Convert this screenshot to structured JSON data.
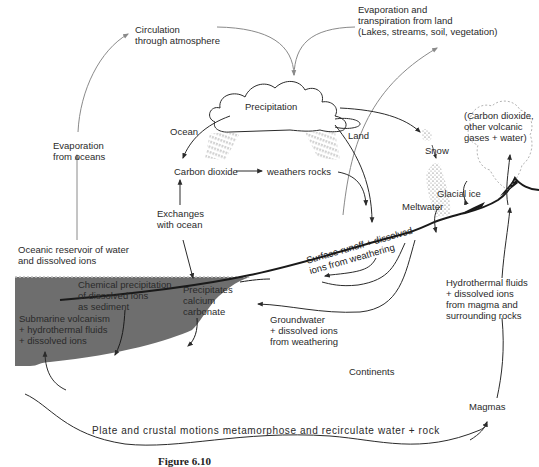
{
  "diagram": {
    "caption": "Figure 6.10",
    "colors": {
      "ocean_fill": "#6e6e6e",
      "line": "#2b2b2b",
      "arrow_light": "#8a8a8a",
      "text": "#2a2a2a",
      "background": "#ffffff"
    },
    "labels": {
      "circulation": "Circulation\nthrough atmosphere",
      "evap_land": "Evaporation and\ntranspiration from land\n(Lakes, streams, soil, vegetation)",
      "evap_oceans": "Evaporation\nfrom oceans",
      "precipitation": "Precipitation",
      "ocean": "Ocean",
      "land": "Land",
      "snow": "Snow",
      "volcanic_gases": "(Carbon dioxide,\nother volcanic\ngases + water)",
      "carbon_dioxide": "Carbon dioxide",
      "weathers_rocks": "weathers rocks",
      "glacial_ice": "Glacial ice",
      "meltwater": "Meltwater",
      "exchanges": "Exchanges\nwith ocean",
      "oceanic_reservoir": "Oceanic reservoir of water\nand dissolved ions",
      "surface_runoff": "Surface runoff + dissolved\nions from weathering",
      "chemical_precip": "Chemical precipitation\nof dissolved ions\nas sediment",
      "precip_caco3": "Precipitates\ncalcium\ncarbonate",
      "submarine": "Submarine volcanism\n+ hydrothermal fluids\n+ dissolved ions",
      "hydrothermal": "Hydrothermal fluids\n+ dissolved ions\nfrom magma and\nsurrounding rocks",
      "groundwater": "Groundwater\n+ dissolved ions\nfrom weathering",
      "continents": "Continents",
      "magmas": "Magmas",
      "plate_motions": "Plate and crustal motions metamorphose and recirculate water + rock"
    }
  }
}
